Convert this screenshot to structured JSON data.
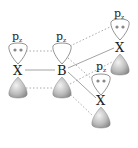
{
  "diagram": {
    "title": "",
    "orbital_label": "p",
    "orbital_subscript": "z",
    "atoms": [
      {
        "id": "x_left",
        "symbol": "X",
        "lone_pair": true
      },
      {
        "id": "b_center",
        "symbol": "B",
        "lone_pair": false
      },
      {
        "id": "x_top_right",
        "symbol": "X",
        "lone_pair": true
      },
      {
        "id": "x_bottom_right",
        "symbol": "X",
        "lone_pair": true
      }
    ],
    "bonds": [
      {
        "from": "x_left",
        "to": "b_center",
        "type": "sigma"
      },
      {
        "from": "b_center",
        "to": "x_top_right",
        "type": "sigma"
      },
      {
        "from": "b_center",
        "to": "x_bottom_right",
        "type": "sigma"
      }
    ],
    "pi_overlaps": [
      {
        "from": "x_left",
        "to": "b_center",
        "style": "dotted"
      },
      {
        "from": "b_center",
        "to": "x_top_right",
        "style": "dotted"
      },
      {
        "from": "b_center",
        "to": "x_bottom_right",
        "style": "dotted"
      }
    ],
    "colors": {
      "upper_lobe": "#ffffff",
      "lower_lobe": "#b8b8b8",
      "outline": "#777777",
      "dotted": "#aaaaaa",
      "bond": "#999999"
    }
  }
}
